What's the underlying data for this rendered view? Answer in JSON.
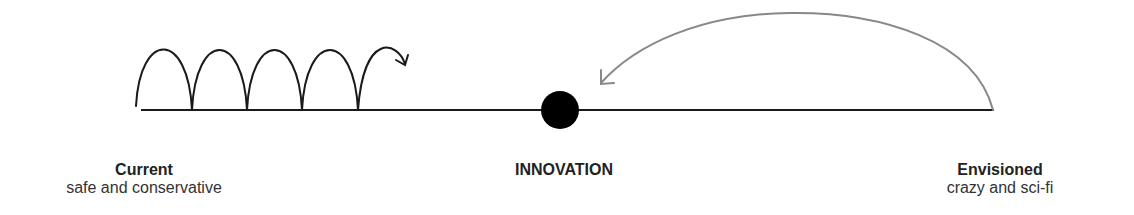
{
  "diagram": {
    "colors": {
      "line": "#1a1a1a",
      "hops": "#1a1a1a",
      "leap_arrow": "#888888",
      "dot": "#000000"
    },
    "left": {
      "title": "Current",
      "subtitle": "safe and conservative"
    },
    "center": {
      "title": "INNOVATION"
    },
    "right": {
      "title": "Envisioned",
      "subtitle": "crazy and sci-fi"
    },
    "hops_count": 5
  }
}
